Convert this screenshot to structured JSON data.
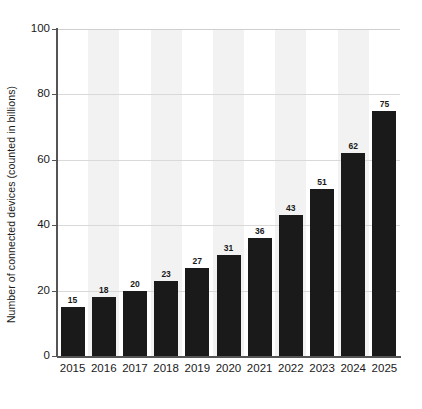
{
  "chart_data": {
    "type": "bar",
    "title": "",
    "subtitle": "",
    "xlabel": "",
    "ylabel": "Number of connected devices (counted in billions)",
    "categories": [
      "2015",
      "2016",
      "2017",
      "2018",
      "2019",
      "2020",
      "2021",
      "2022",
      "2023",
      "2024",
      "2025"
    ],
    "values": [
      15,
      18,
      20,
      23,
      27,
      31,
      36,
      43,
      51,
      62,
      75
    ],
    "value_labels": [
      "15",
      "18",
      "20",
      "23",
      "27",
      "31",
      "36",
      "43",
      "51",
      "62",
      "75"
    ],
    "ylim": [
      0,
      100
    ],
    "ytick_values": [
      0,
      20,
      40,
      60,
      80,
      100
    ],
    "ytick_labels": [
      "0",
      "20",
      "40",
      "60",
      "80",
      "100"
    ],
    "grid": true,
    "grid_axis": "y",
    "legend": false,
    "legend_position": "none",
    "bar_color": "#1a1a1a",
    "band_color": "#f2f2f2",
    "gridline_color": "#d9d9d9",
    "axis_color": "#555555",
    "background_color": "#ffffff",
    "text_color": "#1a1a1a"
  }
}
